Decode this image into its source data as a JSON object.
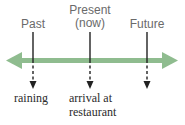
{
  "diagram": {
    "type": "timeline",
    "axis_color": "#8fbc8f",
    "markers": [
      {
        "label_line1": "Past",
        "label_line2": "",
        "event_line1": "raining",
        "event_line2": ""
      },
      {
        "label_line1": "Present",
        "label_line2": "(now)",
        "event_line1": "arrival at",
        "event_line2": "restaurant"
      },
      {
        "label_line1": "Future",
        "label_line2": "",
        "event_line1": "",
        "event_line2": ""
      }
    ]
  }
}
